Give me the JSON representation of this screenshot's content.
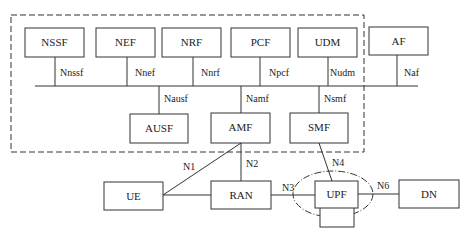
{
  "diagram": {
    "colors": {
      "line": "#333333",
      "background": "#ffffff"
    },
    "core_boundary": {
      "style": "dashed",
      "label": ""
    },
    "nodes": {
      "nssf": "NSSF",
      "nef": "NEF",
      "nrf": "NRF",
      "pcf": "PCF",
      "udm": "UDM",
      "af": "AF",
      "ausf": "AUSF",
      "amf": "AMF",
      "smf": "SMF",
      "ue": "UE",
      "ran": "RAN",
      "upf": "UPF",
      "dn": "DN"
    },
    "service_interfaces": {
      "nnssf": "Nnssf",
      "nnef": "Nnef",
      "nnrf": "Nnrf",
      "npcf": "Npcf",
      "nudm": "Nudm",
      "naf": "Naf",
      "nausf": "Nausf",
      "namf": "Namf",
      "nsmf": "Nsmf"
    },
    "reference_points": {
      "n1": "N1",
      "n2": "N2",
      "n3": "N3",
      "n4": "N4",
      "n6": "N6"
    }
  }
}
